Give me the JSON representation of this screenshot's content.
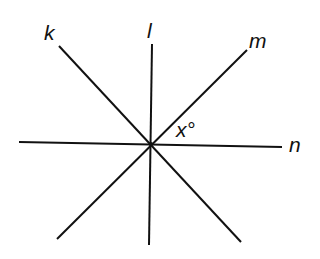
{
  "diagram": {
    "type": "intersecting-lines",
    "center": [
      151,
      144
    ],
    "lines": [
      {
        "name": "k",
        "x1": 59,
        "y1": 46,
        "x2": 241,
        "y2": 242
      },
      {
        "name": "l",
        "x1": 152,
        "y1": 44,
        "x2": 149,
        "y2": 245
      },
      {
        "name": "m",
        "x1": 247,
        "y1": 50,
        "x2": 57,
        "y2": 239
      },
      {
        "name": "n",
        "x1": 19,
        "y1": 142,
        "x2": 282,
        "y2": 147
      }
    ],
    "labels": {
      "k": "k",
      "l": "l",
      "m": "m",
      "n": "n",
      "angle": "x°"
    },
    "stroke_color": "#111111"
  }
}
